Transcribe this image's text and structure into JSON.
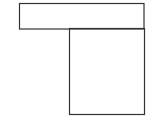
{
  "diagram": {
    "background": "#ffffff",
    "stroke": "#333333",
    "shapes": [
      {
        "name": "top-rectangle",
        "x": 19.5,
        "y": 3.5,
        "w": 124.5,
        "h": 25.5
      },
      {
        "name": "bottom-rectangle",
        "x": 69.5,
        "y": 28.5,
        "w": 75,
        "h": 86
      }
    ]
  }
}
